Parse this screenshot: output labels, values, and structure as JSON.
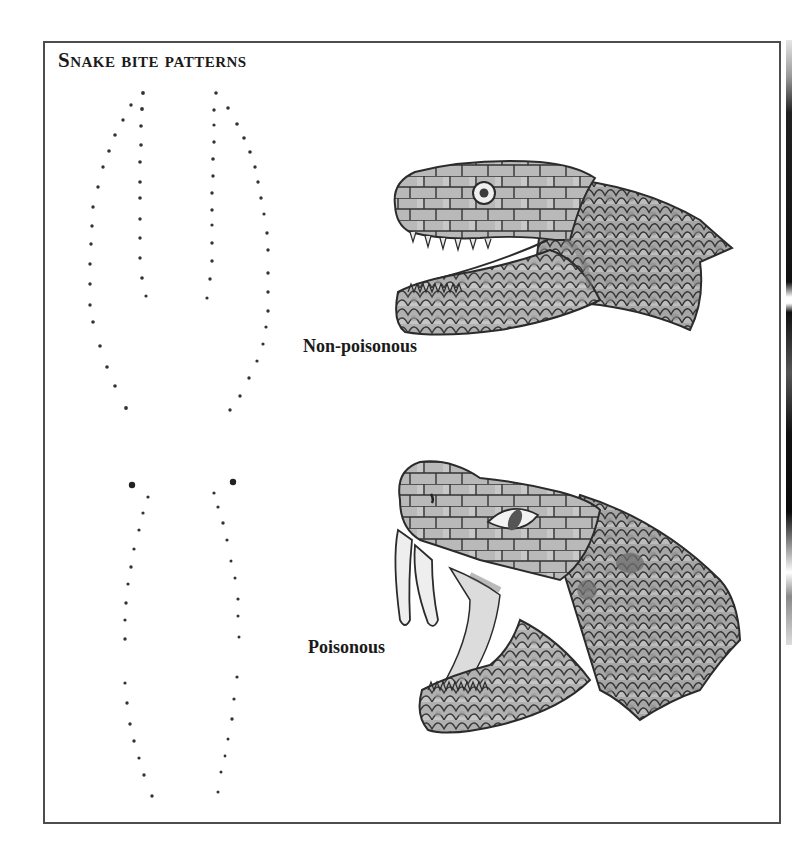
{
  "figure": {
    "title": "Snake bite patterns",
    "panels": [
      {
        "id": "non-poisonous",
        "label": "Non-poisonous",
        "description": "Bite pattern of rows of small teeth marks, no fang punctures",
        "illustration": "non-poisonous-snake-head"
      },
      {
        "id": "poisonous",
        "label": "Poisonous",
        "description": "Bite pattern with two large fang puncture marks above rows of small teeth marks",
        "illustration": "poisonous-snake-head-with-fangs"
      }
    ]
  },
  "colors": {
    "frame_border": "#4d4d4d",
    "text": "#1a1a1a",
    "dots": "#333333",
    "scale_fill": "#a9a9a9",
    "scale_light": "#cfcfcf",
    "scale_dark": "#7c7c7c",
    "outline": "#2b2b2b",
    "fang": "#eeeeee"
  }
}
